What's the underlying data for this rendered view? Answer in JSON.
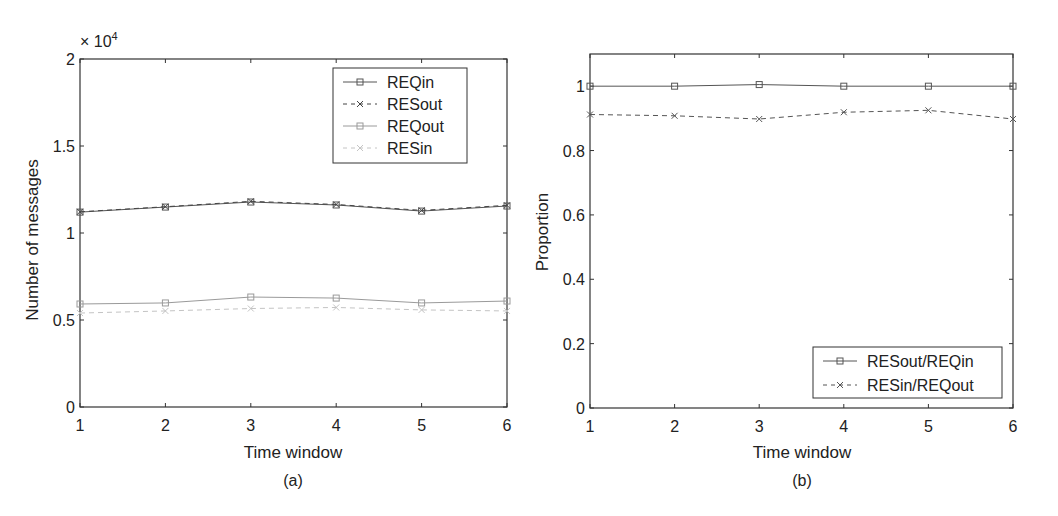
{
  "figure": {
    "panels": [
      "(a)",
      "(b)"
    ]
  },
  "chart_data": [
    {
      "type": "line",
      "panel_label": "(a)",
      "title": "",
      "xlabel": "Time window",
      "ylabel": "Number of messages",
      "y_multiplier_label": "× 10",
      "y_multiplier_exp": "4",
      "x": [
        1,
        2,
        3,
        4,
        5,
        6
      ],
      "xlim": [
        1,
        6
      ],
      "ylim": [
        0,
        20000
      ],
      "xticks": [
        "1",
        "2",
        "3",
        "4",
        "5",
        "6"
      ],
      "yticks": [
        {
          "value": 0,
          "label": "0"
        },
        {
          "value": 5000,
          "label": "0.5"
        },
        {
          "value": 10000,
          "label": "1"
        },
        {
          "value": 15000,
          "label": "1.5"
        },
        {
          "value": 20000,
          "label": "2"
        }
      ],
      "grid": false,
      "legend_position": "upper right",
      "series": [
        {
          "name": "REQin",
          "values": [
            11200,
            11490,
            11780,
            11610,
            11260,
            11550
          ],
          "color": "#555555",
          "dash": "",
          "marker": "square"
        },
        {
          "name": "RESout",
          "values": [
            11220,
            11510,
            11820,
            11640,
            11300,
            11590
          ],
          "color": "#444444",
          "dash": "5,4",
          "marker": "x"
        },
        {
          "name": "REQout",
          "values": [
            5920,
            5980,
            6320,
            6260,
            5980,
            6090
          ],
          "color": "#9a9a9a",
          "dash": "",
          "marker": "square"
        },
        {
          "name": "RESin",
          "values": [
            5400,
            5520,
            5660,
            5720,
            5580,
            5520
          ],
          "color": "#c4c4c4",
          "dash": "5,4",
          "marker": "x"
        }
      ]
    },
    {
      "type": "line",
      "panel_label": "(b)",
      "title": "",
      "xlabel": "Time window",
      "ylabel": "Proportion",
      "x": [
        1,
        2,
        3,
        4,
        5,
        6
      ],
      "xlim": [
        1,
        6
      ],
      "ylim": [
        0,
        1.1
      ],
      "xticks": [
        "1",
        "2",
        "3",
        "4",
        "5",
        "6"
      ],
      "yticks": [
        {
          "value": 0,
          "label": "0"
        },
        {
          "value": 0.2,
          "label": "0.2"
        },
        {
          "value": 0.4,
          "label": "0.4"
        },
        {
          "value": 0.6,
          "label": "0.6"
        },
        {
          "value": 0.8,
          "label": "0.8"
        },
        {
          "value": 1.0,
          "label": "1"
        }
      ],
      "grid": false,
      "legend_position": "lower right",
      "series": [
        {
          "name": "RESout/REQin",
          "values": [
            1.0,
            1.0,
            1.005,
            1.0,
            1.0,
            1.0
          ],
          "color": "#555555",
          "dash": "",
          "marker": "square"
        },
        {
          "name": "RESin/REQout",
          "values": [
            0.912,
            0.908,
            0.898,
            0.919,
            0.925,
            0.898
          ],
          "color": "#555555",
          "dash": "5,4",
          "marker": "x"
        }
      ]
    }
  ]
}
